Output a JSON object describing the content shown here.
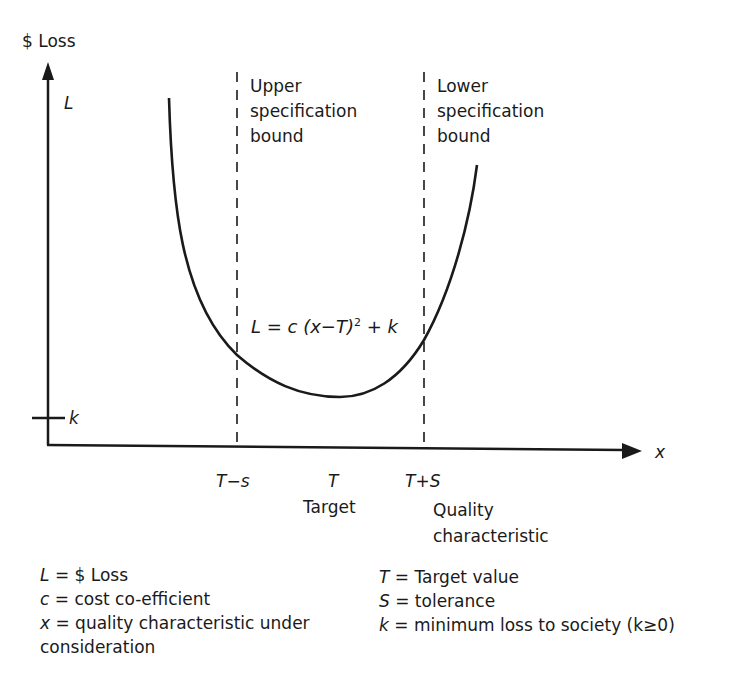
{
  "diagram": {
    "y_axis": {
      "label": "$ Loss",
      "symbol": "L"
    },
    "x_axis": {
      "symbol": "x",
      "label_line1": "Quality",
      "label_line2": "characteristic"
    },
    "k_tick": "k",
    "upper_bound": {
      "line1": "Upper",
      "line2": "specification",
      "line3": "bound"
    },
    "lower_bound": {
      "line1": "Lower",
      "line2": "specification",
      "line3": "bound"
    },
    "formula": {
      "lhs": "L",
      "eq": " = c (x−T)",
      "sup": "2",
      "tail": " + k"
    },
    "x_ticks": [
      {
        "label": "T−s"
      },
      {
        "label": "T",
        "sublabel": "Target"
      },
      {
        "label": "T+S"
      }
    ],
    "colors": {
      "line": "#1a1a1a",
      "background": "#ffffff"
    }
  },
  "legend": {
    "left": [
      {
        "sym": "L",
        "text": " = $ Loss"
      },
      {
        "sym": "c",
        "text": " = cost co-efficient"
      },
      {
        "sym": "x",
        "text": " = quality characteristic under"
      },
      {
        "sym": "",
        "text": "consideration"
      }
    ],
    "right": [
      {
        "sym": "T",
        "text": " = Target value"
      },
      {
        "sym": "S",
        "text": " = tolerance"
      },
      {
        "sym": "k",
        "text": " = minimum loss to society (k≥0)"
      }
    ]
  }
}
